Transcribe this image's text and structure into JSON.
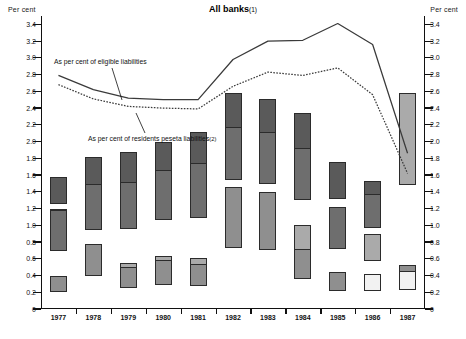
{
  "header": {
    "title": "All banks",
    "title_footnote": "(1)",
    "left_axis_title": "Per cent",
    "right_axis_title": "Per cent"
  },
  "annotations": [
    {
      "id": "eligible-liabilities",
      "text": "As per cent of eligible liabilities",
      "footnote": ""
    },
    {
      "id": "residents-peseta-liabilities",
      "text": "As per cent of residents peseta liabilities",
      "footnote": "(2)"
    }
  ],
  "chart_data": {
    "type": "bar",
    "xlabel": "",
    "ylabel": "Per cent",
    "ylim": [
      0,
      3.5
    ],
    "yticks": [
      0,
      0.2,
      0.4,
      0.6,
      0.8,
      1.0,
      1.2,
      1.4,
      1.6,
      1.8,
      2.0,
      2.2,
      2.4,
      2.6,
      2.8,
      3.0,
      3.2,
      3.4
    ],
    "ytick_labels": [
      "0",
      "0.2",
      "0.4",
      "0.6",
      "0.8",
      "1.0",
      "1.2",
      "1.4",
      "1.6",
      "1.8",
      "2.0",
      "2.2",
      "2.4",
      "2.6",
      "2.8",
      "3.0",
      "3.2",
      "3.4"
    ],
    "grid": false,
    "legend": "none",
    "dual_axis": true,
    "categories": [
      "1977",
      "1978",
      "1979",
      "1980",
      "1981",
      "1982",
      "1983",
      "1984",
      "1985",
      "1986",
      "1987"
    ],
    "stacked_series": [
      {
        "name": "segment-1-dark-grey",
        "color": "#5a5a5a",
        "values": [
          0.32,
          0.42,
          0.44,
          0.46,
          0.46,
          0.45,
          0.43,
          0.44,
          0.44,
          0.21,
          0.12
        ]
      },
      {
        "name": "segment-2-black",
        "color": "#0d0d0d",
        "values": [
          0.25,
          0.04,
          0.03,
          0.02,
          0.1,
          0.14,
          0.16,
          0.16,
          0.16,
          0.14,
          0.09
        ]
      },
      {
        "name": "segment-3-mid-grey",
        "color": "#6e6e6e",
        "values": [
          0.49,
          0.55,
          0.56,
          0.6,
          0.65,
          0.63,
          0.62,
          0.62,
          0.5,
          0.4,
          0.25
        ]
      },
      {
        "name": "segment-4-light-grey",
        "color": "#aaaaaa",
        "values": [
          0.0,
          0.0,
          0.15,
          0.17,
          0.17,
          0.18,
          0.17,
          0.32,
          0.0,
          0.33,
          1.1
        ]
      },
      {
        "name": "segment-5-pale-grey",
        "color": "#8f8f8f",
        "values": [
          0.2,
          0.39,
          0.25,
          0.29,
          0.27,
          0.73,
          0.7,
          0.36,
          0.22,
          0.03,
          0.15
        ]
      },
      {
        "name": "segment-6-white",
        "color": "#f2f2f2",
        "values": [
          0.0,
          0.0,
          0.0,
          0.0,
          0.0,
          0.0,
          0.0,
          0.0,
          0.0,
          0.21,
          0.23
        ]
      }
    ],
    "totals": [
      1.26,
      1.4,
      1.43,
      1.54,
      1.65,
      2.13,
      2.08,
      1.9,
      1.32,
      1.32,
      1.94
    ],
    "series": [
      {
        "name": "As per cent of eligible liabilities",
        "style": "solid",
        "color": "#3a3a3a",
        "x": [
          "1977",
          "1978",
          "1979",
          "1980",
          "1981",
          "1982",
          "1983",
          "1984",
          "1985",
          "1986",
          "1987"
        ],
        "values": [
          2.79,
          2.62,
          2.52,
          2.5,
          2.5,
          2.98,
          3.2,
          3.21,
          3.41,
          3.16,
          1.86
        ]
      },
      {
        "name": "As per cent of residents peseta liabilities (2)",
        "style": "dotted",
        "color": "#3a3a3a",
        "x": [
          "1977",
          "1978",
          "1979",
          "1980",
          "1981",
          "1982",
          "1983",
          "1984",
          "1985",
          "1986",
          "1987"
        ],
        "values": [
          2.68,
          2.51,
          2.42,
          2.4,
          2.39,
          2.66,
          2.83,
          2.79,
          2.88,
          2.56,
          1.62
        ]
      }
    ]
  }
}
